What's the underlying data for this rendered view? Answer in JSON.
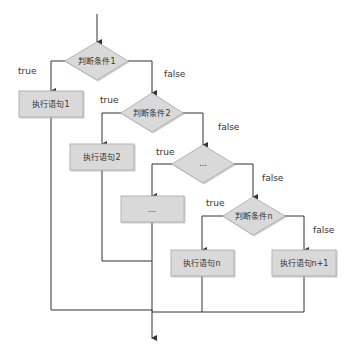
{
  "diagram": {
    "type": "flowchart",
    "title": "",
    "colors": {
      "line": "#333333",
      "node_fill": "#d9d9d9",
      "node_stroke": "#b3b3b3",
      "text": "#333333",
      "background": "#ffffff"
    },
    "decisions": [
      {
        "id": "d1",
        "label": "判断条件1"
      },
      {
        "id": "d2",
        "label": "判断条件2"
      },
      {
        "id": "d3",
        "label": "..."
      },
      {
        "id": "dn",
        "label": "判断条件n"
      }
    ],
    "processes": [
      {
        "id": "p1",
        "label": "执行语句1"
      },
      {
        "id": "p2",
        "label": "执行语句2"
      },
      {
        "id": "p3",
        "label": "..."
      },
      {
        "id": "pn",
        "label": "执行语句n"
      },
      {
        "id": "pn1",
        "label": "执行语句n+1"
      }
    ],
    "edge_labels": {
      "true": "true",
      "false": "false"
    },
    "edges": [
      {
        "from": "start",
        "to": "d1",
        "label": ""
      },
      {
        "from": "d1",
        "to": "p1",
        "label": "true"
      },
      {
        "from": "d1",
        "to": "d2",
        "label": "false"
      },
      {
        "from": "d2",
        "to": "p2",
        "label": "true"
      },
      {
        "from": "d2",
        "to": "d3",
        "label": "false"
      },
      {
        "from": "d3",
        "to": "p3",
        "label": "true"
      },
      {
        "from": "d3",
        "to": "dn",
        "label": "false"
      },
      {
        "from": "dn",
        "to": "pn",
        "label": "true"
      },
      {
        "from": "dn",
        "to": "pn1",
        "label": "false"
      },
      {
        "from": "p1",
        "to": "end",
        "label": ""
      },
      {
        "from": "p2",
        "to": "end",
        "label": ""
      },
      {
        "from": "p3",
        "to": "end",
        "label": ""
      },
      {
        "from": "pn",
        "to": "end",
        "label": ""
      },
      {
        "from": "pn1",
        "to": "end",
        "label": ""
      }
    ]
  }
}
